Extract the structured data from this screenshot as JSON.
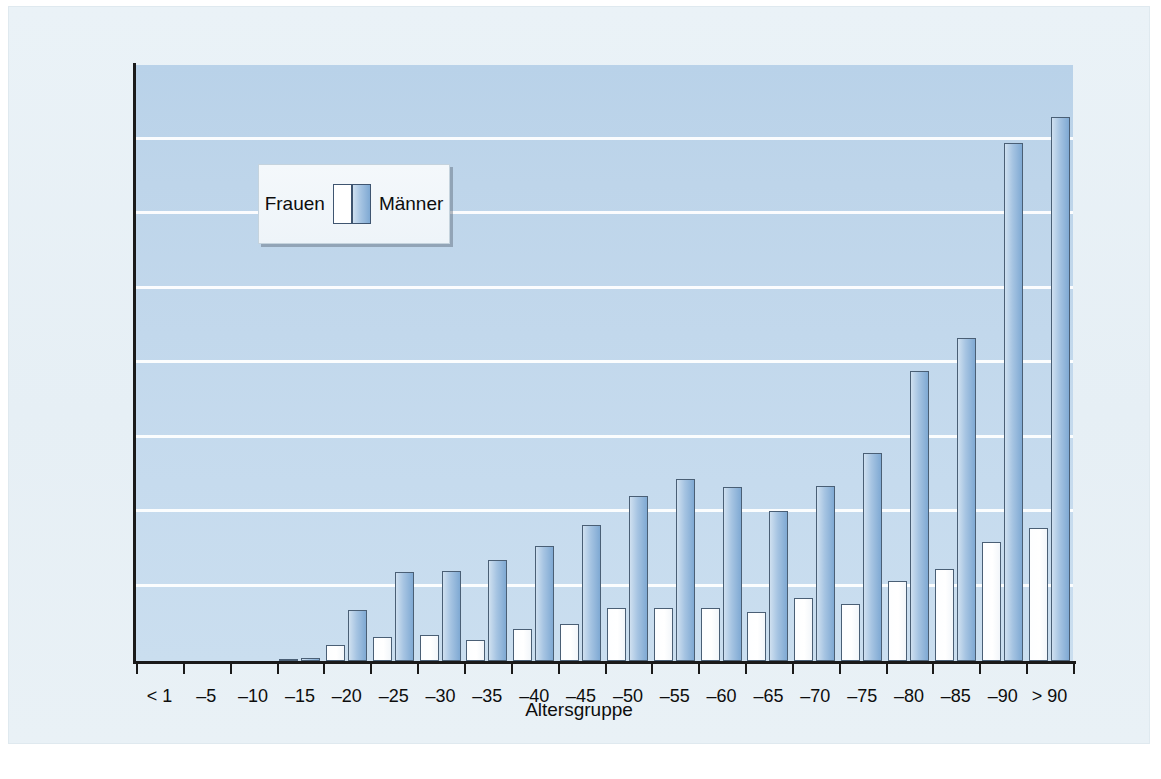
{
  "chart_data": {
    "type": "bar",
    "title": "",
    "xlabel": "Altersgruppe",
    "ylabel": "Suizidrate pro 100 000 Einwohner",
    "ylim": [
      0,
      80
    ],
    "yticks": [
      0,
      10,
      20,
      30,
      40,
      50,
      60,
      70,
      80
    ],
    "grid": true,
    "legend_position": "inside-upper-left",
    "categories": [
      "< 1",
      "–5",
      "–10",
      "–15",
      "–20",
      "–25",
      "–30",
      "–35",
      "–40",
      "–45",
      "–50",
      "–55",
      "–60",
      "–65",
      "–70",
      "–75",
      "–80",
      "–85",
      "–90",
      "> 90"
    ],
    "series": [
      {
        "name": "Frauen",
        "color": "#ffffff",
        "values": [
          0,
          0,
          0,
          0.2,
          2.1,
          3.2,
          3.5,
          2.8,
          4.3,
          5.0,
          7.1,
          7.1,
          7.1,
          6.6,
          8.5,
          7.7,
          10.7,
          12.3,
          16.0,
          17.8
        ]
      },
      {
        "name": "Männer",
        "color": "#8fb4da",
        "values": [
          0,
          0,
          0,
          0.4,
          6.9,
          11.9,
          12.1,
          13.5,
          15.4,
          18.2,
          22.1,
          24.4,
          23.4,
          20.2,
          23.5,
          27.9,
          38.9,
          43.4,
          69.5,
          73.0
        ]
      }
    ]
  },
  "axis": {
    "y_title": "Suizidrate pro 100 000 Einwohner",
    "x_title": "Altersgruppe"
  },
  "legend": {
    "female_label": "Frauen",
    "male_label": "Männer"
  },
  "colors": {
    "page_background": "#ffffff",
    "figure_background": "#e8eff5",
    "plot_background": "#c2d8ec",
    "gridline": "#ffffff",
    "axis": "#1a1a1a",
    "female_bar": "#ffffff",
    "male_bar_light": "#cfe0f0",
    "male_bar_dark": "#7fa9d3",
    "bar_outline": "#4a5f75"
  }
}
